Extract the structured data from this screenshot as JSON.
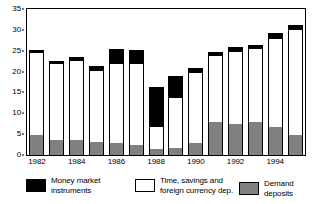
{
  "chart_data": {
    "type": "bar",
    "subtype": "stacked",
    "title": "",
    "subtitle": "",
    "xlabel": "",
    "ylabel": "",
    "ylim": [
      0,
      35
    ],
    "yticks": [
      0,
      5,
      10,
      15,
      20,
      25,
      30,
      35
    ],
    "ytick_labels": [
      "0",
      "5",
      "10",
      "15",
      "20",
      "25",
      "30",
      "35"
    ],
    "grid": false,
    "legend_position": "bottom",
    "categories": [
      "1982",
      "1983",
      "1984",
      "1985",
      "1986",
      "1987",
      "1988",
      "1989",
      "1990",
      "1991",
      "1992",
      "1993",
      "1994",
      "1995"
    ],
    "xtick_labels": [
      "1982",
      "1984",
      "1986",
      "1988",
      "1990",
      "1992",
      "1994"
    ],
    "xtick_categories": [
      "1982",
      "1984",
      "1986",
      "1988",
      "1990",
      "1992",
      "1994"
    ],
    "series": [
      {
        "name": "Demand deposits",
        "color": "#808080",
        "values": [
          4.7,
          3.6,
          3.5,
          3.2,
          3.0,
          2.3,
          1.5,
          1.7,
          2.8,
          7.8,
          7.5,
          8.0,
          6.7,
          4.8
        ]
      },
      {
        "name": "Time, savings and foreign currency dep.",
        "color": "#ffffff",
        "values": [
          20.0,
          18.4,
          19.3,
          17.3,
          19.0,
          19.8,
          5.5,
          12.3,
          17.2,
          16.1,
          17.4,
          17.7,
          21.4,
          25.4
        ]
      },
      {
        "name": "Money market instruments",
        "color": "#000000",
        "values": [
          0.3,
          0.3,
          0.4,
          0.5,
          3.1,
          2.9,
          9.1,
          4.8,
          0.6,
          0.6,
          0.7,
          0.5,
          0.9,
          0.8
        ]
      }
    ],
    "totals": [
      25.0,
      22.3,
      23.2,
      21.0,
      25.1,
      25.0,
      16.1,
      18.8,
      20.6,
      24.5,
      25.6,
      26.2,
      29.0,
      31.0
    ]
  },
  "legend": {
    "items": [
      {
        "label": "Money market\ninstruments",
        "color": "#000000",
        "swatch_name": "legend-swatch-money-market"
      },
      {
        "label": "Time, savings and\nforeign currency dep.",
        "color": "#ffffff",
        "swatch_name": "legend-swatch-time-savings"
      },
      {
        "label": "Demand deposits",
        "color": "#808080",
        "swatch_name": "legend-swatch-demand-deposits"
      }
    ]
  }
}
